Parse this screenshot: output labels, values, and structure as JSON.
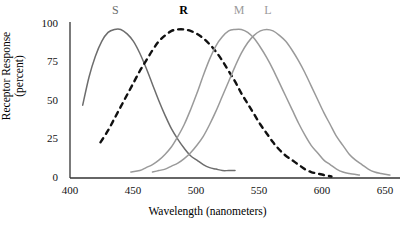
{
  "chart_data": {
    "type": "line",
    "title": "",
    "xlabel": "Wavelength (nanometers)",
    "ylabel": "Receptor Response (percent)",
    "ylabel_line1": "Receptor Response",
    "ylabel_line2": "(percent)",
    "xlim": [
      400,
      660
    ],
    "ylim": [
      0,
      105
    ],
    "xticks": [
      400,
      450,
      500,
      550,
      600,
      650
    ],
    "yticks": [
      0,
      25,
      50,
      75,
      100
    ],
    "xtick_labels": [
      "400",
      "450",
      "500",
      "550",
      "600",
      "650"
    ],
    "ytick_labels": [
      "0",
      "25",
      "50",
      "75",
      "100"
    ],
    "grid": false,
    "legend": "inline-curve-labels",
    "series": [
      {
        "name": "S",
        "label": "S",
        "label_x": 437,
        "label_bold": false,
        "color": "#6d6d6d",
        "style": "solid",
        "peak_nm": 440,
        "x": [
          410,
          415,
          420,
          425,
          430,
          435,
          440,
          445,
          450,
          455,
          460,
          465,
          470,
          475,
          480,
          485,
          490,
          495,
          500,
          505,
          510,
          515,
          520,
          525,
          530
        ],
        "y": [
          49,
          68,
          82,
          92,
          98,
          100,
          100,
          97,
          92,
          84,
          74,
          63,
          52,
          42,
          33,
          26,
          20,
          15,
          12,
          9,
          7,
          6,
          5,
          5,
          5
        ]
      },
      {
        "name": "R",
        "label": "R",
        "label_x": 490,
        "label_bold": true,
        "color": "#111111",
        "style": "dashed",
        "peak_nm": 492,
        "x": [
          424,
          430,
          435,
          440,
          445,
          450,
          455,
          460,
          465,
          470,
          475,
          480,
          485,
          490,
          495,
          500,
          505,
          510,
          515,
          520,
          525,
          530,
          535,
          540,
          545,
          550,
          555,
          560,
          565,
          570,
          575,
          580,
          585,
          590,
          595,
          600,
          606
        ],
        "y": [
          24,
          32,
          40,
          48,
          56,
          64,
          72,
          79,
          86,
          92,
          96,
          99,
          100,
          100,
          99,
          97,
          94,
          90,
          85,
          79,
          72,
          65,
          57,
          50,
          43,
          36,
          30,
          24,
          19,
          15,
          12,
          9,
          6,
          4,
          3,
          2,
          1
        ]
      },
      {
        "name": "M",
        "label": "M",
        "label_x": 533,
        "label_bold": false,
        "color": "#9a9a9a",
        "style": "solid",
        "peak_nm": 534,
        "x": [
          448,
          455,
          460,
          465,
          470,
          475,
          480,
          485,
          490,
          495,
          500,
          505,
          510,
          515,
          520,
          525,
          530,
          535,
          540,
          545,
          550,
          555,
          560,
          565,
          570,
          575,
          580,
          585,
          590,
          595,
          600,
          605,
          610,
          615,
          620,
          628
        ],
        "y": [
          4,
          5,
          7,
          9,
          12,
          16,
          21,
          28,
          36,
          46,
          57,
          69,
          80,
          89,
          95,
          99,
          100,
          100,
          98,
          94,
          88,
          81,
          73,
          64,
          55,
          46,
          37,
          29,
          22,
          17,
          12,
          9,
          6,
          4,
          3,
          2
        ]
      },
      {
        "name": "L",
        "label": "L",
        "label_x": 557,
        "label_bold": false,
        "color": "#9a9a9a",
        "style": "solid",
        "peak_nm": 556,
        "x": [
          465,
          470,
          475,
          480,
          485,
          490,
          495,
          500,
          505,
          510,
          515,
          520,
          525,
          530,
          535,
          540,
          545,
          550,
          555,
          560,
          565,
          570,
          575,
          580,
          585,
          590,
          595,
          600,
          605,
          610,
          615,
          620,
          625,
          630,
          635,
          640,
          645,
          652
        ],
        "y": [
          4,
          5,
          6,
          8,
          10,
          13,
          17,
          22,
          28,
          36,
          45,
          55,
          65,
          75,
          84,
          91,
          96,
          99,
          100,
          99,
          96,
          92,
          86,
          79,
          71,
          62,
          53,
          44,
          36,
          28,
          22,
          16,
          12,
          9,
          6,
          4,
          3,
          2
        ]
      }
    ]
  },
  "axes": {
    "axis_color": "#333333"
  }
}
